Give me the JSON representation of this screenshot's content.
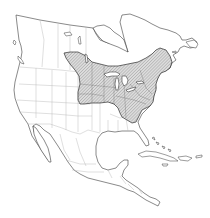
{
  "map": {
    "region": "North America",
    "type": "species range map",
    "colors": {
      "background": "#ffffff",
      "land_fill": "#ffffff",
      "coastline": "#3a3a3a",
      "political_borders": "#b8b8b8",
      "range_fill": "#d8d8d8",
      "range_hatch": "#8a8a8a",
      "range_outline": "#2e2e2e"
    },
    "layers": [
      {
        "name": "land-mass",
        "description": "North and Central America coastline outline"
      },
      {
        "name": "political-borders",
        "description": "country, state and province boundaries"
      },
      {
        "name": "range-area",
        "description": "hatched shaded range over eastern United States and southern Canada"
      },
      {
        "name": "great-lakes",
        "description": "lakes within range"
      },
      {
        "name": "caribbean-islands",
        "description": "Cuba, Hispaniola, Bahamas, Jamaica, Puerto Rico"
      }
    ]
  }
}
